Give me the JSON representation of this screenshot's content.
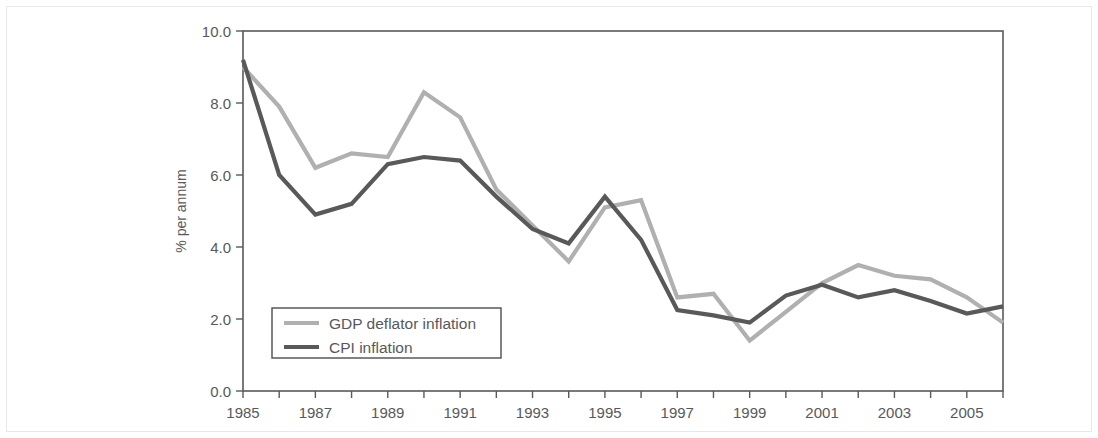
{
  "chart_data": {
    "type": "line",
    "title": "",
    "xlabel": "",
    "ylabel": "% per annum",
    "xlim": [
      1985,
      2006
    ],
    "ylim": [
      0.0,
      10.0
    ],
    "grid": false,
    "legend_position": "inside-bottom-left",
    "x": [
      1985,
      1986,
      1987,
      1988,
      1989,
      1990,
      1991,
      1992,
      1993,
      1994,
      1995,
      1996,
      1997,
      1998,
      1999,
      2000,
      2001,
      2002,
      2003,
      2004,
      2005,
      2006
    ],
    "x_tick_labels": [
      "1985",
      "",
      "1987",
      "",
      "1989",
      "",
      "1991",
      "",
      "1993",
      "",
      "1995",
      "",
      "1997",
      "",
      "1999",
      "",
      "2001",
      "",
      "2003",
      "",
      "2005",
      ""
    ],
    "y_tick_labels": [
      "0.0",
      "2.0",
      "4.0",
      "6.0",
      "8.0",
      "10.0"
    ],
    "y_ticks": [
      0.0,
      2.0,
      4.0,
      6.0,
      8.0,
      10.0
    ],
    "series": [
      {
        "name": "GDP deflator inflation",
        "color": "#b0b0b0",
        "values": [
          9.0,
          7.9,
          6.2,
          6.6,
          6.5,
          8.3,
          7.6,
          5.6,
          4.6,
          3.6,
          5.1,
          5.3,
          2.6,
          2.7,
          1.4,
          2.2,
          3.0,
          3.5,
          3.2,
          3.1,
          2.6,
          1.9
        ]
      },
      {
        "name": "CPI inflation",
        "color": "#595959",
        "values": [
          9.2,
          6.0,
          4.9,
          5.2,
          6.3,
          6.5,
          6.4,
          5.4,
          4.5,
          4.1,
          5.4,
          4.2,
          2.25,
          2.1,
          1.9,
          2.65,
          2.95,
          2.6,
          2.8,
          2.5,
          2.15,
          2.35
        ]
      }
    ]
  },
  "axis": {
    "y_axis_title": "% per annum"
  },
  "legend": {
    "entries": [
      {
        "label": "GDP deflator inflation",
        "color": "#b0b0b0"
      },
      {
        "label": "CPI inflation",
        "color": "#595959"
      }
    ]
  }
}
